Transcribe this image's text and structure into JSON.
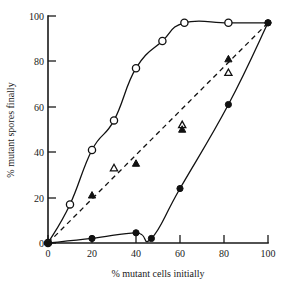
{
  "chart_data": {
    "type": "line",
    "title": "",
    "xlabel": "% mutant cells initially",
    "ylabel": "% mutant spores finally",
    "xlim": [
      0,
      100
    ],
    "ylim": [
      0,
      100
    ],
    "xticks": [
      0,
      20,
      40,
      60,
      80,
      100
    ],
    "yticks": [
      0,
      20,
      40,
      60,
      80,
      100
    ],
    "xtick_labels": [
      "0",
      "20",
      "40",
      "60",
      "80",
      "100"
    ],
    "ytick_labels": [
      "0",
      "20",
      "40",
      "60",
      "80",
      "100"
    ],
    "grid": false,
    "legend": "none",
    "series": [
      {
        "name": "open-circles",
        "marker": "open circle",
        "line": "solid",
        "points": [
          {
            "x": 0,
            "y": 0
          },
          {
            "x": 10,
            "y": 17
          },
          {
            "x": 20,
            "y": 41
          },
          {
            "x": 30,
            "y": 54
          },
          {
            "x": 40,
            "y": 77
          },
          {
            "x": 52,
            "y": 89
          },
          {
            "x": 62,
            "y": 97
          },
          {
            "x": 82,
            "y": 97
          },
          {
            "x": 100,
            "y": 97
          }
        ]
      },
      {
        "name": "filled-circles",
        "marker": "filled circle",
        "line": "solid",
        "points": [
          {
            "x": 0,
            "y": 0
          },
          {
            "x": 20,
            "y": 2
          },
          {
            "x": 40,
            "y": 4.5
          },
          {
            "x": 47,
            "y": 2
          },
          {
            "x": 60,
            "y": 24
          },
          {
            "x": 82,
            "y": 61
          },
          {
            "x": 100,
            "y": 97
          }
        ]
      },
      {
        "name": "triangles-diagonal",
        "marker": "triangles (open and filled)",
        "line": "dashed",
        "line_points": [
          {
            "x": 0,
            "y": 0
          },
          {
            "x": 100,
            "y": 97
          }
        ],
        "filled_points": [
          {
            "x": 20,
            "y": 21
          },
          {
            "x": 40,
            "y": 35
          },
          {
            "x": 61,
            "y": 50
          },
          {
            "x": 82,
            "y": 81
          }
        ],
        "open_points": [
          {
            "x": 30,
            "y": 33
          },
          {
            "x": 61,
            "y": 52
          },
          {
            "x": 82,
            "y": 75
          }
        ]
      }
    ]
  },
  "axes": {
    "x_label": "% mutant cells initially",
    "y_label": "% mutant spores finally"
  }
}
